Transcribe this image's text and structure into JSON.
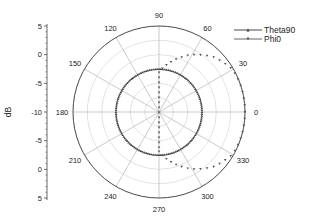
{
  "chart_data": {
    "type": "polar",
    "title": "",
    "ylabel": "dB",
    "radial_range": [
      -10,
      5
    ],
    "radial_ticks_left_axis": [
      "5",
      "0",
      "-5",
      "-10",
      "-5",
      "0",
      "5"
    ],
    "radial_ring_step": 2.5,
    "angle_ticks": [
      0,
      30,
      60,
      90,
      120,
      150,
      180,
      210,
      240,
      270,
      300,
      330
    ],
    "angle_tick_labels": [
      "0",
      "30",
      "60",
      "90",
      "120",
      "150",
      "180",
      "210",
      "240",
      "270",
      "300",
      "330"
    ],
    "grid": true,
    "legend_position": "top-right",
    "series": [
      {
        "name": "Theta90",
        "marker": "triangle-up",
        "color": "#444444",
        "description": "omnidirectional, constant level",
        "angles": [
          0,
          30,
          60,
          90,
          120,
          150,
          180,
          210,
          240,
          270,
          300,
          330,
          360
        ],
        "values": [
          -2.5,
          -2.5,
          -2.5,
          -2.5,
          -2.5,
          -2.5,
          -2.5,
          -2.5,
          -2.5,
          -2.5,
          -2.5,
          -2.5,
          -2.5
        ]
      },
      {
        "name": "Phi0",
        "marker": "triangle-down",
        "color": "#555555",
        "description": "directional lobe toward 0 deg; collapses toward center for 90-270 deg",
        "angles": [
          0,
          15,
          30,
          45,
          60,
          75,
          90,
          120,
          150,
          180,
          210,
          240,
          270,
          285,
          300,
          315,
          330,
          345,
          360
        ],
        "values": [
          5.0,
          5.0,
          4.8,
          3.5,
          1.5,
          -0.8,
          -3.1,
          -5.5,
          -8.0,
          -10.0,
          -8.0,
          -5.5,
          -3.1,
          -0.8,
          1.5,
          3.5,
          4.8,
          5.0,
          5.0
        ]
      }
    ]
  },
  "legend": {
    "items": [
      {
        "label": "Theta90"
      },
      {
        "label": "Phi0"
      }
    ]
  },
  "axis": {
    "ylabel": "dB"
  }
}
